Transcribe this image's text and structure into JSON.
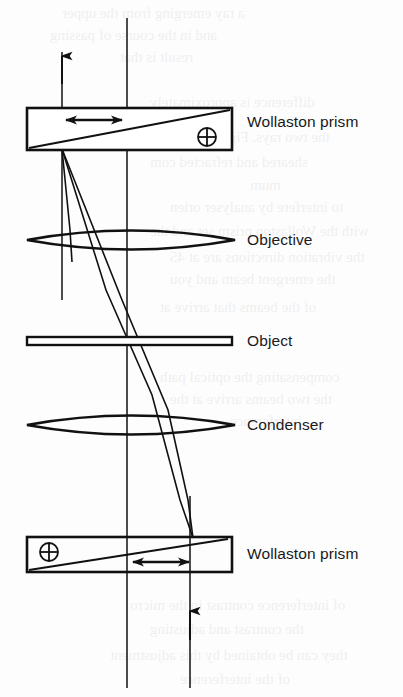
{
  "figure": {
    "background_color": "#fdfdfd",
    "ink_color": "#111111",
    "labels": [
      {
        "id": "wollaston-prism-top",
        "text": "Wollaston prism",
        "x": 247,
        "y": 122
      },
      {
        "id": "objective",
        "text": "Objective",
        "x": 247,
        "y": 233
      },
      {
        "id": "object",
        "text": "Object",
        "x": 247,
        "y": 333
      },
      {
        "id": "condenser",
        "text": "Condenser",
        "x": 247,
        "y": 418
      },
      {
        "id": "wollaston-prism-bottom",
        "text": "Wollaston prism",
        "x": 247,
        "y": 546
      }
    ],
    "components": [
      {
        "id": "wollaston-prism-top",
        "type": "prism",
        "x": 27,
        "y": 108,
        "width": 205,
        "height": 42,
        "symbol": "circle-plus",
        "symbol_x": 207,
        "symbol_y": 137,
        "shear_arrow": "double-headed-horizontal"
      },
      {
        "id": "objective",
        "type": "lens",
        "cx": 131,
        "cy": 240,
        "half_width": 104,
        "half_height": 15
      },
      {
        "id": "object",
        "type": "specimen-slide",
        "x": 27,
        "y": 337,
        "width": 205,
        "height": 8
      },
      {
        "id": "condenser",
        "type": "lens",
        "cx": 131,
        "cy": 425,
        "half_width": 104,
        "half_height": 15
      },
      {
        "id": "wollaston-prism-bottom",
        "type": "prism",
        "x": 27,
        "y": 537,
        "width": 205,
        "height": 35,
        "symbol": "circle-plus",
        "symbol_x": 49,
        "symbol_y": 552,
        "shear_arrow": "double-headed-horizontal"
      }
    ],
    "axes": [
      {
        "id": "optical-axis-left",
        "x": 127,
        "y1": 18,
        "y2": 688
      },
      {
        "id": "optical-axis-right",
        "x": 190,
        "y1": 496,
        "y2": 688
      },
      {
        "id": "illumination-axis-upper",
        "x": 62,
        "y1": 52,
        "y2": 300
      }
    ],
    "direction_arrows": [
      {
        "id": "output-arrow-top",
        "x": 62,
        "y_tip": 55,
        "direction": "up"
      },
      {
        "id": "input-arrow-bottom",
        "x": 190,
        "y_tip": 610,
        "direction": "up"
      }
    ],
    "bleed_text": [
      {
        "text": "a ray emerging from the upper",
        "x": 62,
        "y": 6,
        "size": 15
      },
      {
        "text": "and in the course of passing",
        "x": 50,
        "y": 28,
        "size": 15
      },
      {
        "text": "result is that",
        "x": 120,
        "y": 50,
        "size": 15
      },
      {
        "text": "difference is approximately",
        "x": 150,
        "y": 95,
        "size": 15
      },
      {
        "text": "the two rays. Figure 12.7 illus",
        "x": 150,
        "y": 130,
        "size": 15
      },
      {
        "text": "sheared and refracted com",
        "x": 150,
        "y": 155,
        "size": 15
      },
      {
        "text": "mum",
        "x": 250,
        "y": 178,
        "size": 15
      },
      {
        "text": "to interfere by analyser orien",
        "x": 170,
        "y": 200,
        "size": 15
      },
      {
        "text": "with the Wollaston prism set and the",
        "x": 150,
        "y": 224,
        "size": 15
      },
      {
        "text": "the vibration directions are at 45",
        "x": 170,
        "y": 250,
        "size": 15
      },
      {
        "text": "the emergent beam and you",
        "x": 170,
        "y": 272,
        "size": 15
      },
      {
        "text": "of the beams that arrive at",
        "x": 160,
        "y": 300,
        "size": 15
      },
      {
        "text": "compensating the optical path",
        "x": 160,
        "y": 370,
        "size": 15
      },
      {
        "text": "the two beams arrive at the",
        "x": 170,
        "y": 392,
        "size": 15
      },
      {
        "text": "interference",
        "x": 230,
        "y": 414,
        "size": 15
      },
      {
        "text": "of interference contrast in the micro",
        "x": 130,
        "y": 598,
        "size": 15
      },
      {
        "text": "the contrast and adjusting",
        "x": 150,
        "y": 622,
        "size": 15
      },
      {
        "text": "they can be obtained by this adjustment",
        "x": 110,
        "y": 648,
        "size": 15
      },
      {
        "text": "of the interference",
        "x": 180,
        "y": 672,
        "size": 15
      }
    ]
  }
}
